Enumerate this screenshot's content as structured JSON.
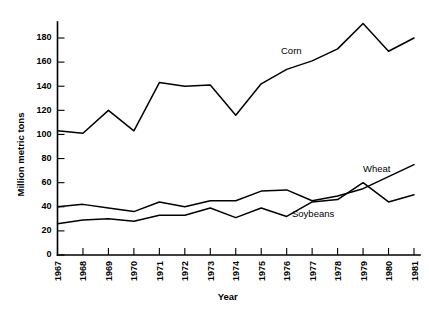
{
  "chart_data": {
    "type": "line",
    "title": "",
    "subtitle": "",
    "xlabel": "Year",
    "ylabel": "Million metric tons",
    "grid": false,
    "legend_position": "inline-annotations",
    "categories": [
      "1967",
      "1968",
      "1969",
      "1970",
      "1971",
      "1972",
      "1973",
      "1974",
      "1975",
      "1976",
      "1977",
      "1978",
      "1979",
      "1980",
      "1981"
    ],
    "x": [
      1967,
      1968,
      1969,
      1970,
      1971,
      1972,
      1973,
      1974,
      1975,
      1976,
      1977,
      1978,
      1979,
      1980,
      1981
    ],
    "xlim": [
      1967,
      1981
    ],
    "ylim": [
      0,
      195
    ],
    "yticks": [
      0,
      20,
      40,
      60,
      80,
      100,
      120,
      140,
      160,
      180
    ],
    "ytick_labels": [
      "0",
      "20",
      "40",
      "60",
      "80",
      "100",
      "120",
      "140",
      "160",
      "180"
    ],
    "xtick_labels": [
      "1967",
      "1968",
      "1969",
      "1970",
      "1971",
      "1972",
      "1973",
      "1974",
      "1975",
      "1976",
      "1977",
      "1978",
      "1979",
      "1980",
      "1981"
    ],
    "series": [
      {
        "name": "Corn",
        "label": "Corn",
        "values": [
          103,
          101,
          120,
          103,
          143,
          140,
          141,
          116,
          142,
          154,
          161,
          171,
          192,
          169,
          180
        ]
      },
      {
        "name": "Wheat",
        "label": "Wheat",
        "values": [
          40,
          42,
          39,
          36,
          44,
          40,
          45,
          45,
          53,
          54,
          45,
          49,
          55,
          65,
          75
        ]
      },
      {
        "name": "Soybeans",
        "label": "Soybeans",
        "values": [
          26,
          29,
          30,
          28,
          33,
          33,
          39,
          31,
          39,
          32,
          44,
          46,
          60,
          44,
          50
        ]
      }
    ],
    "annotations": [
      {
        "text": "Corn",
        "series": "Corn"
      },
      {
        "text": "Wheat",
        "series": "Wheat"
      },
      {
        "text": "Soybeans",
        "series": "Soybeans"
      }
    ]
  }
}
